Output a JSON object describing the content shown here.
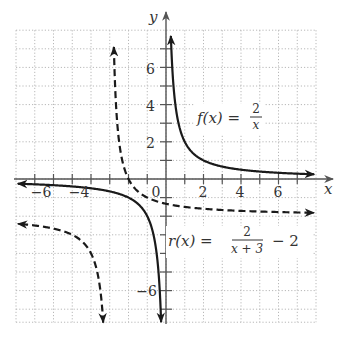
{
  "chart_data": {
    "type": "line",
    "title": "",
    "xlabel": "x",
    "ylabel": "y",
    "xlim": [
      -8,
      8
    ],
    "ylim": [
      -7.7,
      8
    ],
    "grid": true,
    "x_ticks": [
      -7,
      -6,
      -5,
      -4,
      -3,
      -2,
      -1,
      1,
      2,
      3,
      4,
      5,
      6,
      7
    ],
    "x_tick_labels": [
      {
        "value": -6,
        "text": "−6"
      },
      {
        "value": -4,
        "text": "−4"
      },
      {
        "value": 0,
        "text": "0"
      },
      {
        "value": 2,
        "text": "2"
      },
      {
        "value": 4,
        "text": "4"
      },
      {
        "value": 6,
        "text": "6"
      }
    ],
    "y_ticks": [
      -7,
      -6,
      -5,
      -4,
      -3,
      -2,
      -1,
      1,
      2,
      3,
      4,
      5,
      6,
      7
    ],
    "y_tick_labels": [
      {
        "value": 6,
        "text": "6"
      },
      {
        "value": 4,
        "text": "4"
      },
      {
        "value": 2,
        "text": "2"
      },
      {
        "value": -6,
        "text": "−6"
      }
    ],
    "series": [
      {
        "name": "f(x) = 2/x",
        "style": "solid",
        "formula": "2/x",
        "asymptotes": {
          "vertical": 0,
          "horizontal": 0
        },
        "branches": [
          {
            "x_from": 0.26,
            "x_to": 7.9
          },
          {
            "x_from": -7.9,
            "x_to": -0.26
          }
        ]
      },
      {
        "name": "r(x) = 2/(x+3) - 2",
        "style": "dashed",
        "formula": "2/(x+3)-2",
        "asymptotes": {
          "vertical": -3,
          "horizontal": -2
        },
        "branches": [
          {
            "x_from": -2.78,
            "x_to": 7.9
          },
          {
            "x_from": -7.9,
            "x_to": -3.35
          }
        ]
      }
    ],
    "annotations": [
      {
        "text_lhs": "f(x) =",
        "numerator": "2",
        "denominator": "x",
        "near": [
          3.5,
          3.5
        ]
      },
      {
        "text_lhs": "r(x) =",
        "numerator": "2",
        "denominator": "x + 3",
        "suffix": "− 2",
        "near": [
          4,
          -3.5
        ]
      }
    ]
  },
  "labels": {
    "x_axis": "x",
    "y_axis": "y",
    "f_lhs": "f(x) =",
    "f_num": "2",
    "f_den": "x",
    "r_lhs": "r(x) =",
    "r_num": "2",
    "r_den": "x + 3",
    "r_suffix": "− 2",
    "tick_m6": "−6",
    "tick_m4": "−4",
    "tick_0": "0",
    "tick_2": "2",
    "tick_4": "4",
    "tick_6": "6",
    "ytick_6": "6",
    "ytick_4": "4",
    "ytick_2": "2",
    "ytick_m6": "−6"
  },
  "colors": {
    "curve": "#1a1a1a",
    "axis": "#555555",
    "grid": "#b8b8b8",
    "text": "#333333"
  }
}
